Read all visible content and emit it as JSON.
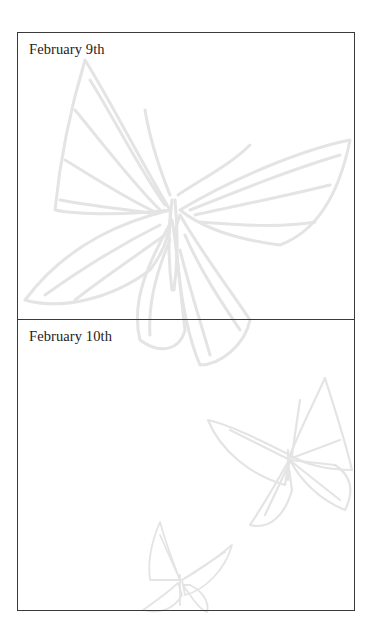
{
  "entries": [
    {
      "date": "February 9th",
      "body": ""
    },
    {
      "date": "February 10th",
      "body": ""
    }
  ],
  "colors": {
    "border": "#3a3a3a",
    "text": "#222222",
    "watermark": "#e6e6e6",
    "background": "#ffffff"
  },
  "background_art": [
    "large-butterfly-watermark",
    "medium-butterfly-watermark",
    "small-butterfly-watermark"
  ]
}
